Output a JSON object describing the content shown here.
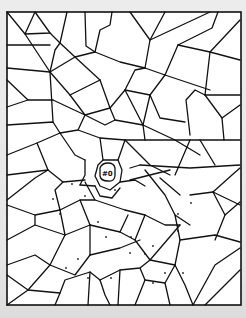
{
  "page": {
    "type": "coloring-page-mosaic",
    "background_color": "#e6e6e6",
    "paper_color": "#ffffff",
    "line_color": "#111111"
  },
  "frame": {
    "x": 7,
    "y": 12,
    "width": 234,
    "height": 293
  },
  "center_figure": {
    "description": "small creature face in center of mosaic",
    "label": "#0"
  }
}
